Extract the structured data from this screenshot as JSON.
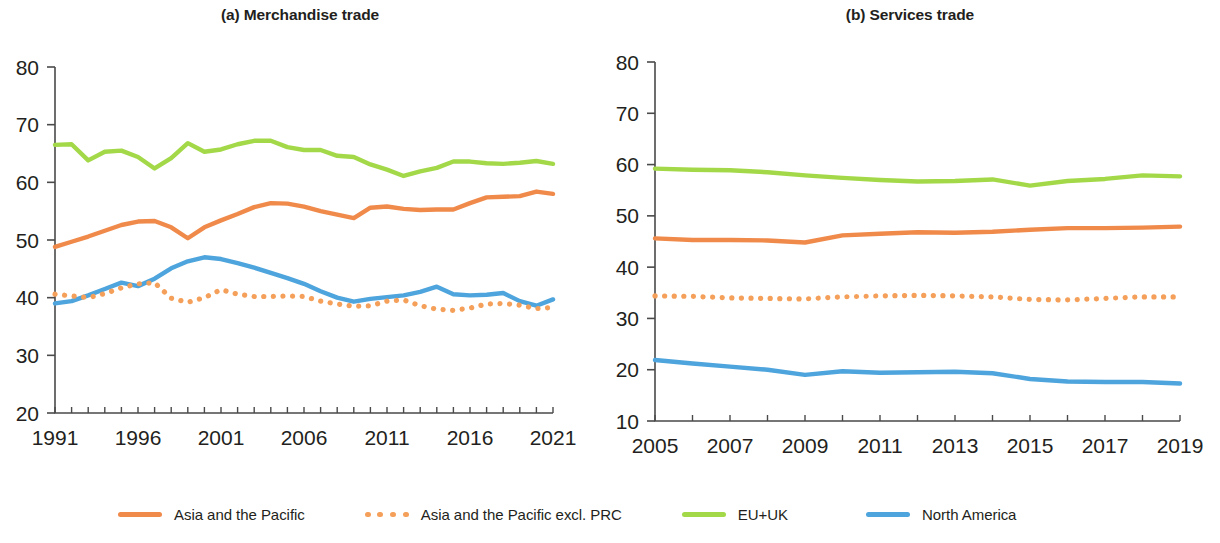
{
  "figure": {
    "background_color": "#ffffff",
    "text_color": "#231f20"
  },
  "panels": [
    {
      "id": "a",
      "title": "(a) Merchandise trade"
    },
    {
      "id": "b",
      "title": "(b) Services trade"
    }
  ],
  "legend": {
    "items": [
      {
        "label": "Asia and the Pacific",
        "color": "#F08A4B",
        "style": "solid"
      },
      {
        "label": "Asia and the Pacific excl. PRC",
        "color": "#F5A05A",
        "style": "dotted"
      },
      {
        "label": "EU+UK",
        "color": "#A3D949",
        "style": "solid"
      },
      {
        "label": "North America",
        "color": "#4EA4DC",
        "style": "solid"
      }
    ]
  },
  "chart_data": [
    {
      "type": "line",
      "panel": "a",
      "title": "(a) Merchandise trade",
      "xlabel": "",
      "ylabel": "",
      "grid": false,
      "legend_position": "bottom",
      "xlim": [
        1991,
        2021
      ],
      "ylim": [
        20,
        80
      ],
      "ytick_labels": [
        "20",
        "30",
        "40",
        "50",
        "60",
        "70",
        "80"
      ],
      "yticks": [
        20,
        30,
        40,
        50,
        60,
        70,
        80
      ],
      "xtick_labels": [
        "1991",
        "1996",
        "2001",
        "2006",
        "2011",
        "2016",
        "2021"
      ],
      "xticks": [
        1991,
        1996,
        2001,
        2006,
        2011,
        2016,
        2021
      ],
      "x": [
        1991,
        1992,
        1993,
        1994,
        1995,
        1996,
        1997,
        1998,
        1999,
        2000,
        2001,
        2002,
        2003,
        2004,
        2005,
        2006,
        2007,
        2008,
        2009,
        2010,
        2011,
        2012,
        2013,
        2014,
        2015,
        2016,
        2017,
        2018,
        2019,
        2020,
        2021
      ],
      "series": [
        {
          "name": "EU+UK",
          "color": "#A3D949",
          "style": "solid",
          "values": [
            66.5,
            66.6,
            63.8,
            65.3,
            65.5,
            64.4,
            62.4,
            64.2,
            66.8,
            65.3,
            65.7,
            66.6,
            67.2,
            67.2,
            66.1,
            65.6,
            65.6,
            64.6,
            64.4,
            63.1,
            62.2,
            61.1,
            61.9,
            62.5,
            63.6,
            63.6,
            63.3,
            63.2,
            63.4,
            63.7,
            63.2
          ]
        },
        {
          "name": "Asia and the Pacific",
          "color": "#F08A4B",
          "style": "solid",
          "values": [
            48.8,
            49.7,
            50.6,
            51.6,
            52.6,
            53.2,
            53.3,
            52.2,
            50.3,
            52.2,
            53.4,
            54.5,
            55.7,
            56.4,
            56.3,
            55.8,
            55.0,
            54.4,
            53.8,
            55.6,
            55.8,
            55.4,
            55.2,
            55.3,
            55.3,
            56.4,
            57.4,
            57.5,
            57.6,
            58.4,
            58.0
          ]
        },
        {
          "name": "North America",
          "color": "#4EA4DC",
          "style": "solid",
          "values": [
            39.0,
            39.4,
            40.4,
            41.5,
            42.6,
            42.0,
            43.3,
            45.1,
            46.3,
            47.0,
            46.7,
            46.0,
            45.2,
            44.3,
            43.4,
            42.4,
            41.1,
            40.0,
            39.3,
            39.8,
            40.1,
            40.4,
            41.0,
            41.9,
            40.6,
            40.4,
            40.5,
            40.8,
            39.4,
            38.6,
            39.7
          ]
        },
        {
          "name": "Asia and the Pacific excl. PRC",
          "color": "#F5A05A",
          "style": "dotted",
          "values": [
            40.6,
            40.3,
            40.0,
            40.7,
            41.7,
            42.4,
            42.6,
            39.9,
            39.2,
            40.0,
            41.4,
            40.6,
            40.2,
            40.2,
            40.3,
            40.2,
            39.4,
            38.9,
            38.5,
            38.6,
            39.4,
            39.6,
            38.6,
            38.0,
            37.8,
            38.2,
            38.9,
            39.0,
            38.7,
            38.1,
            38.3
          ]
        }
      ]
    },
    {
      "type": "line",
      "panel": "b",
      "title": "(b) Services trade",
      "xlabel": "",
      "ylabel": "",
      "grid": false,
      "legend_position": "bottom",
      "xlim": [
        2005,
        2019
      ],
      "ylim": [
        10,
        80
      ],
      "ytick_labels": [
        "10",
        "20",
        "30",
        "40",
        "50",
        "60",
        "70",
        "80"
      ],
      "yticks": [
        10,
        20,
        30,
        40,
        50,
        60,
        70,
        80
      ],
      "xtick_labels": [
        "2005",
        "2007",
        "2009",
        "2011",
        "2013",
        "2015",
        "2017",
        "2019"
      ],
      "xticks": [
        2005,
        2007,
        2009,
        2011,
        2013,
        2015,
        2017,
        2019
      ],
      "x": [
        2005,
        2006,
        2007,
        2008,
        2009,
        2010,
        2011,
        2012,
        2013,
        2014,
        2015,
        2016,
        2017,
        2018,
        2019
      ],
      "series": [
        {
          "name": "EU+UK",
          "color": "#A3D949",
          "style": "solid",
          "values": [
            59.2,
            59.0,
            58.9,
            58.5,
            57.9,
            57.4,
            57.0,
            56.7,
            56.8,
            57.1,
            55.9,
            56.8,
            57.2,
            57.9,
            57.7
          ]
        },
        {
          "name": "Asia and the Pacific",
          "color": "#F08A4B",
          "style": "solid",
          "values": [
            45.6,
            45.3,
            45.3,
            45.2,
            44.8,
            46.2,
            46.5,
            46.8,
            46.7,
            46.9,
            47.3,
            47.6,
            47.6,
            47.7,
            47.9
          ]
        },
        {
          "name": "Asia and the Pacific excl. PRC",
          "color": "#F5A05A",
          "style": "dotted",
          "values": [
            34.4,
            34.3,
            34.0,
            33.9,
            33.8,
            34.2,
            34.4,
            34.5,
            34.4,
            34.2,
            33.7,
            33.6,
            33.9,
            34.2,
            34.2
          ]
        },
        {
          "name": "North America",
          "color": "#4EA4DC",
          "style": "solid",
          "values": [
            21.9,
            21.2,
            20.6,
            20.0,
            19.0,
            19.7,
            19.4,
            19.5,
            19.6,
            19.3,
            18.2,
            17.7,
            17.6,
            17.6,
            17.3
          ]
        }
      ]
    }
  ]
}
